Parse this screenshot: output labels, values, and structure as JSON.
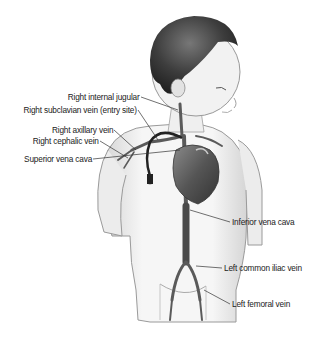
{
  "figure": {
    "colors": {
      "background": "#ffffff",
      "skin_outline": "#9a9a9a",
      "hair": "#3a3a3a",
      "vein": "#5a5a5a",
      "heart": "#4a4a4a",
      "label_text": "#222222",
      "leader_line": "#333333"
    }
  },
  "labels": {
    "left": [
      {
        "id": "right-internal-jugular",
        "text": "Right internal jugular"
      },
      {
        "id": "right-subclavian-vein",
        "text": "Right subclavian vein (entry site)"
      },
      {
        "id": "right-axillary-vein",
        "text": "Right axillary vein"
      },
      {
        "id": "right-cephalic-vein",
        "text": "Right cephalic vein"
      },
      {
        "id": "superior-vena-cava",
        "text": "Superior vena cava"
      }
    ],
    "right": [
      {
        "id": "inferior-vena-cava",
        "text": "Inferior vena cava"
      },
      {
        "id": "left-common-iliac-vein",
        "text": "Left common iliac vein"
      },
      {
        "id": "left-femoral-vein",
        "text": "Left femoral vein"
      }
    ]
  }
}
